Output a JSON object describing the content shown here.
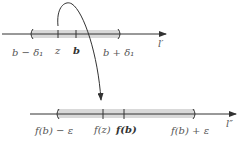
{
  "colors": {
    "band": "#d9d9d9",
    "axis": "#333333",
    "curve": "#333333",
    "label": "#555555"
  },
  "top_line": {
    "name": "l′",
    "interval_left_label": "b − δ₁",
    "interval_right_label": "b + δ₁",
    "tick_z_label": "z",
    "tick_b_label": "b"
  },
  "bottom_line": {
    "name": "l″",
    "interval_left_label": "f(b) − ε",
    "interval_right_label": "f(b) + ε",
    "tick_fz_label": "f(z)",
    "tick_fb_label": "f(b)"
  },
  "mapping_arrow": {
    "from": "z",
    "to": "f(z)"
  }
}
